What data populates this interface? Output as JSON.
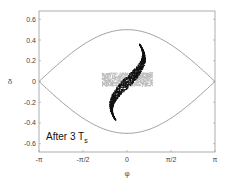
{
  "chart_data": {
    "type": "scatter",
    "title": "",
    "xlabel": "φ",
    "ylabel": "δ",
    "xlim": [
      -3.14159,
      3.14159
    ],
    "ylim": [
      -0.68,
      0.68
    ],
    "xticks": [
      {
        "value": -3.14159,
        "label": "-π"
      },
      {
        "value": -1.5708,
        "label": "-π/2"
      },
      {
        "value": 0,
        "label": "0"
      },
      {
        "value": 1.5708,
        "label": "π/2"
      },
      {
        "value": 3.14159,
        "label": "π"
      }
    ],
    "yticks": [
      {
        "value": 0.6,
        "label": "0.6"
      },
      {
        "value": 0.4,
        "label": "0.4"
      },
      {
        "value": 0.2,
        "label": "0.2"
      },
      {
        "value": 0,
        "label": "0"
      },
      {
        "value": -0.2,
        "label": "-0.2"
      },
      {
        "value": -0.4,
        "label": "-0.4"
      },
      {
        "value": -0.6,
        "label": "-0.6"
      }
    ],
    "grid": false,
    "annotation": {
      "text": "After 3 T",
      "subscript": "s",
      "x": -2.9,
      "y": -0.52
    },
    "series": [
      {
        "name": "separatrix",
        "kind": "line",
        "color": "#888888",
        "amplitude": 0.5,
        "shape": "0.5*cos(φ/2)"
      },
      {
        "name": "initial distribution",
        "kind": "scatter-band",
        "color": "#bbbbbb",
        "phi_range": [
          -0.9,
          0.9
        ],
        "delta_range": [
          -0.04,
          0.09
        ]
      },
      {
        "name": "distribution after 3 Ts",
        "kind": "scatter-filament",
        "color": "#111111",
        "shape": "S-shaped filament from (-0.6,-0.35) through (0,0) to (0.55,0.35)"
      }
    ]
  },
  "axes": {
    "xlabel": "φ",
    "ylabel": "δ",
    "annotation_main": "After 3 T",
    "annotation_sub": "s"
  }
}
